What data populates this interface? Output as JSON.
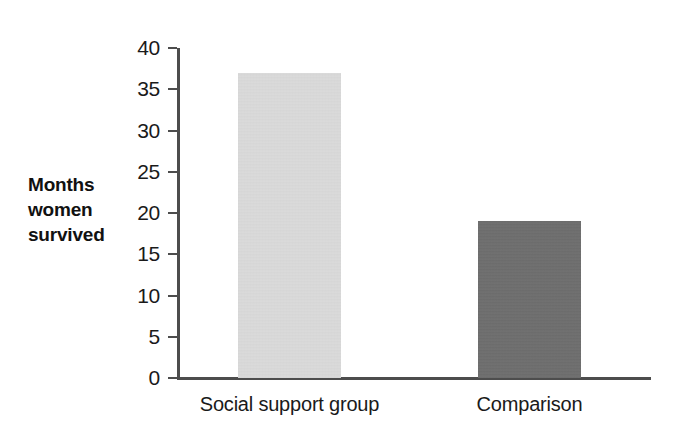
{
  "chart_data": {
    "type": "bar",
    "title": "",
    "subtitle": "",
    "xlabel": "",
    "ylabel": "Months women survived",
    "ylabel_lines": [
      "Months",
      "women",
      "survived"
    ],
    "categories": [
      "Social support group",
      "Comparison"
    ],
    "values": [
      37,
      19
    ],
    "series": [
      {
        "name": "Months women survived",
        "values": [
          37,
          19
        ]
      }
    ],
    "ylim": [
      0,
      40
    ],
    "ytick_step": 5,
    "yticks": [
      40,
      35,
      30,
      25,
      20,
      15,
      10,
      5,
      0
    ],
    "ytick_labels": [
      "40",
      "35",
      "30",
      "25",
      "20",
      "15",
      "10",
      "5",
      "0"
    ],
    "grid": false,
    "legend": false,
    "legend_position": "none",
    "annotations": [],
    "bar_colors": [
      "#dcdcdc",
      "#6e6e6e"
    ],
    "axis_color": "#4d4d4d",
    "background_color": "#ffffff",
    "text_color": "#1a1a1a"
  }
}
